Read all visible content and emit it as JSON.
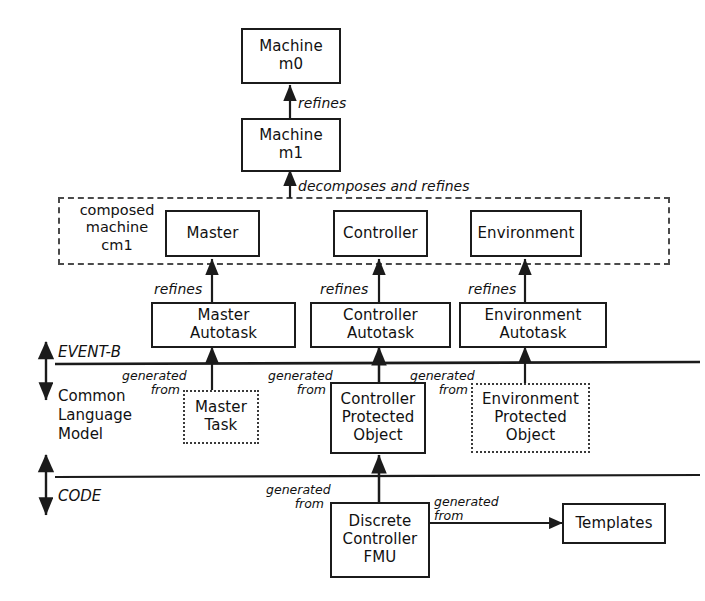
{
  "diagram": {
    "colors": {
      "stroke": "#1b1b1b",
      "dotted_stroke": "#3a3a3a",
      "dashed_group": "#4a4a4a",
      "background": "#ffffff",
      "text": "#111111"
    }
  },
  "nodes": {
    "machine_m0": {
      "label": "Machine\nm0"
    },
    "machine_m1": {
      "label": "Machine\nm1"
    },
    "master": {
      "label": "Master"
    },
    "controller": {
      "label": "Controller"
    },
    "environment": {
      "label": "Environment"
    },
    "master_autotask": {
      "label": "Master\nAutotask"
    },
    "controller_autotask": {
      "label": "Controller\nAutotask"
    },
    "environment_autotask": {
      "label": "Environment\nAutotask"
    },
    "master_task": {
      "label": "Master\nTask"
    },
    "controller_protected_object": {
      "label": "Controller\nProtected\nObject"
    },
    "environment_protected_object": {
      "label": "Environment\nProtected\nObject"
    },
    "discrete_controller_fmu": {
      "label": "Discrete\nController\nFMU"
    },
    "templates": {
      "label": "Templates"
    }
  },
  "group": {
    "composed_machine_label": "composed\nmachine\ncm1"
  },
  "edges": {
    "m1_refines_m0": "refines",
    "cm1_decomposes_refines_m1": "decomposes and refines",
    "master_autotask_refines_master": "refines",
    "controller_autotask_refines_controller": "refines",
    "environment_autotask_refines_environment": "refines",
    "master_task_generated_from": "generated\nfrom",
    "controller_object_generated_from": "generated\nfrom",
    "environment_object_generated_from": "generated\nfrom",
    "fmu_generated_from": "generated\nfrom",
    "templates_generated_from": "generated\nfrom"
  },
  "layers": {
    "event_b": "EVENT-B",
    "common_language_model": "Common\nLanguage\nModel",
    "code": "CODE"
  }
}
